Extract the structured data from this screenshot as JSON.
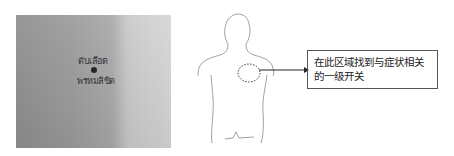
{
  "photo": {
    "handwriting_line1": "ตับเลือด",
    "handwriting_line2": "พรหมลิขิต",
    "marker": "acupoint-dot"
  },
  "diagram": {
    "figure": "human-back-outline",
    "highlight": "dashed-ellipse-right-scapula",
    "arrow_color": "#222222"
  },
  "callout": {
    "text": "在此区域找到与症状相关的一级开关"
  }
}
